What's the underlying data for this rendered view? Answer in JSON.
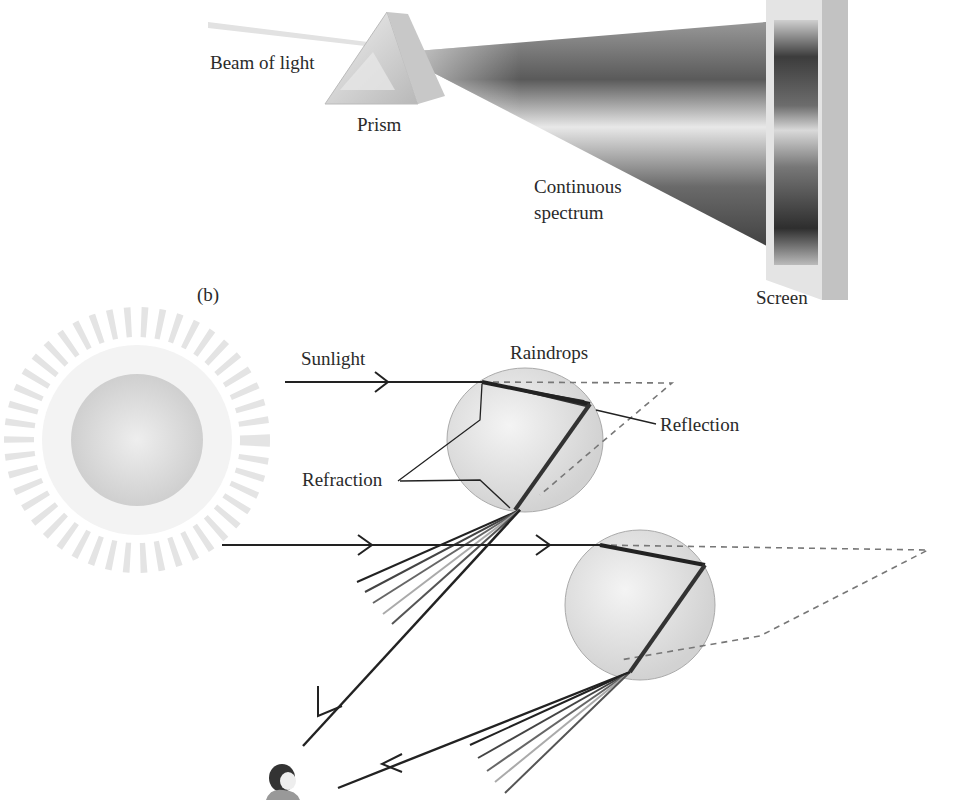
{
  "panel_a": {
    "labels": {
      "beam": "Beam of light",
      "prism": "Prism",
      "spectrum_line1": "Continuous",
      "spectrum_line2": "spectrum",
      "screen": "Screen"
    }
  },
  "panel_b": {
    "tag": "(b)",
    "labels": {
      "sunlight": "Sunlight",
      "raindrops": "Raindrops",
      "reflection": "Reflection",
      "refraction": "Refraction"
    }
  },
  "colors": {
    "line": "#222222",
    "dashed": "#777777",
    "drop_fill": "#dcdcdc",
    "sun_fill": "#d8d8d8"
  }
}
